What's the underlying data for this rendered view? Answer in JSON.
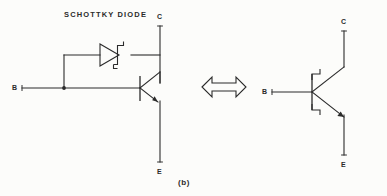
{
  "figure": {
    "caption": "(b)",
    "background_color": "#fcfcfa",
    "ink_color": "#2b2b2b"
  },
  "left_circuit": {
    "title": "SCHOTTKY DIODE",
    "terminals": {
      "base": "B",
      "collector": "C",
      "emitter": "E"
    },
    "components": {
      "diode_name": "schottky-diode-symbol",
      "transistor_name": "npn-transistor-symbol",
      "transistor_type": "NPN"
    }
  },
  "equivalence": {
    "symbol_name": "double-headed-arrow",
    "glyph": "⟺"
  },
  "right_circuit": {
    "terminals": {
      "base": "B",
      "collector": "C",
      "emitter": "E"
    },
    "components": {
      "transistor_name": "schottky-transistor-symbol",
      "transistor_type": "NPN Schottky"
    }
  }
}
